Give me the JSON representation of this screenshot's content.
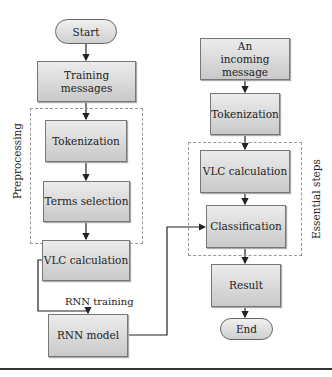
{
  "diagram": {
    "left_flow": {
      "start": "Start",
      "training_messages": "Training messages",
      "preprocessing_label": "Preprocessing",
      "tokenization": "Tokenization",
      "terms_selection": "Terms selection",
      "vlc_calculation": "VLC calculation",
      "rnn_training_label": "RNN training",
      "rnn_model": "RNN model"
    },
    "right_flow": {
      "incoming_message": "An incoming message",
      "tokenization": "Tokenization",
      "essential_steps_label": "Essential steps",
      "vlc_calculation": "VLC calculation",
      "classification": "Classification",
      "result": "Result",
      "end": "End"
    }
  }
}
